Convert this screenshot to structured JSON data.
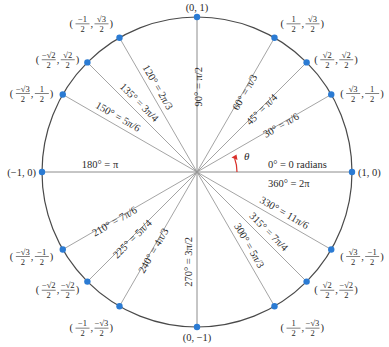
{
  "diagram": {
    "center_px": [
      197,
      172
    ],
    "radius_px": 155,
    "colors": {
      "circle": "#4a4a4a",
      "rays": "#9a9a9a",
      "points": "#2b7bd3",
      "theta_arrow": "#d9302a",
      "text": "#2a2a2a"
    },
    "theta_label": "θ",
    "angles": [
      {
        "deg": 0,
        "label": "0° = 0 radians",
        "coord": "(1, 0)"
      },
      {
        "deg": 30,
        "label": "30° = π/6",
        "coord_x": "√3/2",
        "coord_y": "1/2"
      },
      {
        "deg": 45,
        "label": "45° = π/4",
        "coord_x": "√2/2",
        "coord_y": "√2/2"
      },
      {
        "deg": 60,
        "label": "60° = π/3",
        "coord_x": "1/2",
        "coord_y": "√3/2"
      },
      {
        "deg": 90,
        "label": "90° = π/2",
        "coord": "(0, 1)"
      },
      {
        "deg": 120,
        "label": "120° = 2π/3",
        "coord_x": "−1/2",
        "coord_y": "√3/2"
      },
      {
        "deg": 135,
        "label": "135° = 3π/4",
        "coord_x": "−√2/2",
        "coord_y": "√2/2"
      },
      {
        "deg": 150,
        "label": "150° = 5π/6",
        "coord_x": "−√3/2",
        "coord_y": "1/2"
      },
      {
        "deg": 180,
        "label": "180° = π",
        "coord": "(−1, 0)"
      },
      {
        "deg": 210,
        "label": "210° = 7π/6",
        "coord_x": "−√3/2",
        "coord_y": "−1/2"
      },
      {
        "deg": 225,
        "label": "225° = 5π/4",
        "coord_x": "−√2/2",
        "coord_y": "−√2/2"
      },
      {
        "deg": 240,
        "label": "240° = 4π/3",
        "coord_x": "−1/2",
        "coord_y": "−√3/2"
      },
      {
        "deg": 270,
        "label": "270° = 3π/2",
        "coord": "(0, −1)"
      },
      {
        "deg": 300,
        "label": "300° = 5π/3",
        "coord_x": "1/2",
        "coord_y": "−√3/2"
      },
      {
        "deg": 315,
        "label": "315° = 7π/4",
        "coord_x": "√2/2",
        "coord_y": "−√2/2"
      },
      {
        "deg": 330,
        "label": "330° = 11π/6",
        "coord_x": "√3/2",
        "coord_y": "−1/2"
      }
    ],
    "extra_labels": {
      "full_turn": "360° = 2π"
    }
  }
}
